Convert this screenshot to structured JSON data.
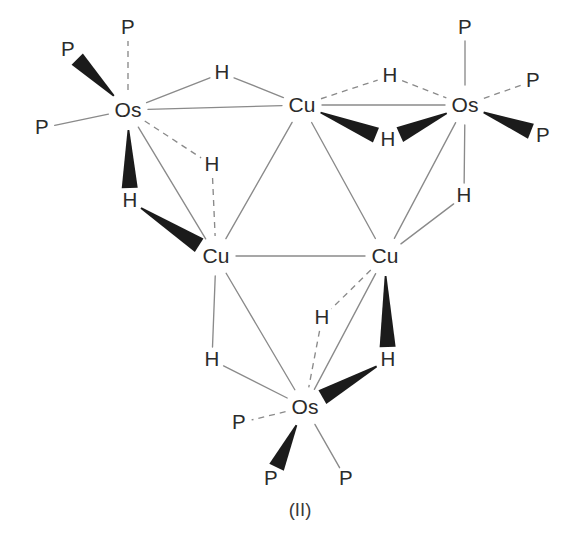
{
  "figure": {
    "caption": "(II)",
    "background_color": "#ffffff",
    "bond_color": "#8a8a8a",
    "wedge_color": "#1b1b1b",
    "label_color": "#2b2b2b"
  },
  "chart_data": {
    "type": "diagram",
    "title": "(II)",
    "atoms": [
      {
        "id": "os_left",
        "element": "Os",
        "x": 128,
        "y": 110
      },
      {
        "id": "os_right",
        "element": "Os",
        "x": 465,
        "y": 105
      },
      {
        "id": "os_bottom",
        "element": "Os",
        "x": 305,
        "y": 407
      },
      {
        "id": "cu_top",
        "element": "Cu",
        "x": 302,
        "y": 105
      },
      {
        "id": "cu_left",
        "element": "Cu",
        "x": 216,
        "y": 256
      },
      {
        "id": "cu_right",
        "element": "Cu",
        "x": 385,
        "y": 256
      },
      {
        "id": "p_l_top",
        "element": "P",
        "x": 128,
        "y": 28
      },
      {
        "id": "p_l_upper",
        "element": "P",
        "x": 68,
        "y": 50
      },
      {
        "id": "p_l_lower",
        "element": "P",
        "x": 42,
        "y": 128
      },
      {
        "id": "p_r_top",
        "element": "P",
        "x": 465,
        "y": 28
      },
      {
        "id": "p_r_upper",
        "element": "P",
        "x": 533,
        "y": 81
      },
      {
        "id": "p_r_lower",
        "element": "P",
        "x": 543,
        "y": 136
      },
      {
        "id": "p_b_left",
        "element": "P",
        "x": 239,
        "y": 423
      },
      {
        "id": "p_b_mid",
        "element": "P",
        "x": 271,
        "y": 479
      },
      {
        "id": "p_b_right",
        "element": "P",
        "x": 346,
        "y": 479
      },
      {
        "id": "h_top_left",
        "element": "H",
        "x": 222,
        "y": 73
      },
      {
        "id": "h_top_right",
        "element": "H",
        "x": 390,
        "y": 76
      },
      {
        "id": "h_os_r_low",
        "element": "H",
        "x": 388,
        "y": 140
      },
      {
        "id": "h_os_l_low",
        "element": "H",
        "x": 130,
        "y": 201
      },
      {
        "id": "h_mid_left",
        "element": "H",
        "x": 212,
        "y": 165
      },
      {
        "id": "h_right_mid",
        "element": "H",
        "x": 464,
        "y": 196
      },
      {
        "id": "h_bot_left",
        "element": "H",
        "x": 212,
        "y": 360
      },
      {
        "id": "h_bot_mid",
        "element": "H",
        "x": 322,
        "y": 318
      },
      {
        "id": "h_bot_right",
        "element": "H",
        "x": 388,
        "y": 360
      }
    ],
    "bonds": [
      {
        "from": "os_left",
        "to": "cu_top",
        "style": "solid"
      },
      {
        "from": "cu_top",
        "to": "os_right",
        "style": "solid"
      },
      {
        "from": "os_left",
        "to": "cu_left",
        "style": "solid"
      },
      {
        "from": "cu_top",
        "to": "cu_left",
        "style": "solid"
      },
      {
        "from": "cu_top",
        "to": "cu_right",
        "style": "solid"
      },
      {
        "from": "os_right",
        "to": "cu_right",
        "style": "solid"
      },
      {
        "from": "cu_left",
        "to": "cu_right",
        "style": "solid"
      },
      {
        "from": "cu_left",
        "to": "os_bottom",
        "style": "solid"
      },
      {
        "from": "cu_right",
        "to": "os_bottom",
        "style": "solid"
      },
      {
        "from": "os_left",
        "to": "h_top_left",
        "style": "solid"
      },
      {
        "from": "h_top_left",
        "to": "cu_top",
        "style": "solid"
      },
      {
        "from": "cu_top",
        "to": "h_top_right",
        "style": "dashed"
      },
      {
        "from": "h_top_right",
        "to": "os_right",
        "style": "dashed"
      },
      {
        "from": "cu_top",
        "to": "h_os_r_low",
        "style": "wedge"
      },
      {
        "from": "os_right",
        "to": "h_os_r_low",
        "style": "wedge"
      },
      {
        "from": "os_left",
        "to": "h_os_l_low",
        "style": "wedge"
      },
      {
        "from": "h_os_l_low",
        "to": "cu_left",
        "style": "wedge"
      },
      {
        "from": "os_left",
        "to": "h_mid_left",
        "style": "dashed"
      },
      {
        "from": "h_mid_left",
        "to": "cu_left",
        "style": "dashed"
      },
      {
        "from": "os_right",
        "to": "h_right_mid",
        "style": "solid"
      },
      {
        "from": "h_right_mid",
        "to": "cu_right",
        "style": "solid"
      },
      {
        "from": "cu_left",
        "to": "h_bot_left",
        "style": "solid"
      },
      {
        "from": "h_bot_left",
        "to": "os_bottom",
        "style": "solid"
      },
      {
        "from": "cu_right",
        "to": "h_bot_mid",
        "style": "dashed"
      },
      {
        "from": "h_bot_mid",
        "to": "os_bottom",
        "style": "dashed"
      },
      {
        "from": "cu_right",
        "to": "h_bot_right",
        "style": "wedge"
      },
      {
        "from": "h_bot_right",
        "to": "os_bottom",
        "style": "wedge"
      },
      {
        "from": "os_left",
        "to": "p_l_top",
        "style": "dashed"
      },
      {
        "from": "os_left",
        "to": "p_l_upper",
        "style": "wedge"
      },
      {
        "from": "os_left",
        "to": "p_l_lower",
        "style": "solid"
      },
      {
        "from": "os_right",
        "to": "p_r_top",
        "style": "solid"
      },
      {
        "from": "os_right",
        "to": "p_r_upper",
        "style": "dashed"
      },
      {
        "from": "os_right",
        "to": "p_r_lower",
        "style": "wedge"
      },
      {
        "from": "os_bottom",
        "to": "p_b_left",
        "style": "dashed"
      },
      {
        "from": "os_bottom",
        "to": "p_b_mid",
        "style": "wedge"
      },
      {
        "from": "os_bottom",
        "to": "p_b_right",
        "style": "solid"
      }
    ],
    "labels": {
      "os": "Os",
      "cu": "Cu",
      "p": "P",
      "h": "H"
    }
  }
}
